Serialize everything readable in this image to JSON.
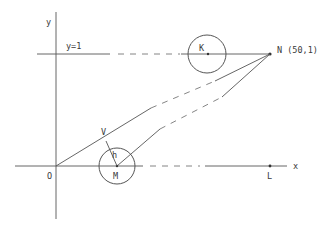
{
  "diagram": {
    "type": "geometry",
    "axes": {
      "x_label": "x",
      "y_label": "y",
      "origin_label": "O"
    },
    "reference_line": {
      "label": "y=1"
    },
    "points": {
      "N": {
        "label": "N (50,1)"
      },
      "K": {
        "label": "K"
      },
      "M": {
        "label": "M"
      },
      "L": {
        "label": "L"
      },
      "V": {
        "label": "V"
      }
    },
    "segments": {
      "perpendicular_label": "h"
    },
    "circles": [
      {
        "center": "K",
        "description": "circle centered at K on line y=1"
      },
      {
        "center": "M",
        "description": "circle centered at M on x-axis"
      }
    ],
    "lines": [
      {
        "from": "O",
        "to": "N",
        "style": "solid-dashed-solid"
      },
      {
        "from": "M",
        "to": "N",
        "style": "solid-dashed-solid"
      },
      {
        "from": "V",
        "to": "M",
        "label": "h",
        "style": "solid"
      }
    ],
    "colors": {
      "stroke": "#555555",
      "background": "#ffffff"
    }
  }
}
